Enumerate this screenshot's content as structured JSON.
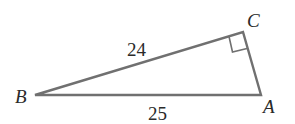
{
  "diagram": {
    "type": "right-triangle",
    "vertices": [
      {
        "name": "B",
        "label": "B"
      },
      {
        "name": "C",
        "label": "C"
      },
      {
        "name": "A",
        "label": "A"
      }
    ],
    "sides": [
      {
        "name": "BC",
        "label": "24"
      },
      {
        "name": "BA",
        "label": "25"
      }
    ],
    "right_angle_at": "C",
    "colors": {
      "stroke": "#6e6e6e",
      "text": "#2a2a2a"
    }
  }
}
